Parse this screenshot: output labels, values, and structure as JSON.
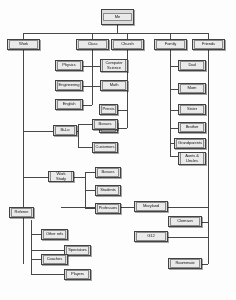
{
  "diagram": {
    "type": "org-chart",
    "root": {
      "label": "Me"
    },
    "branches": [
      {
        "label": "Work"
      },
      {
        "label": "Class"
      },
      {
        "label": "Church"
      },
      {
        "label": "Family"
      },
      {
        "label": "Friends"
      }
    ],
    "nodes": {
      "me": "Me",
      "work": "Work",
      "class": "Class",
      "church": "Church",
      "family": "Family",
      "friends": "Friends",
      "physics": "Physics",
      "computer_science": "Computer Science",
      "engineering": "Engineering",
      "math": "Math",
      "english": "English",
      "priests": "Priests",
      "peers": "Peers",
      "bilo": "Bi-Lo",
      "bilo_bosses": "Bosses",
      "bilo_customers": "Customers",
      "work_study": "Work Study",
      "ws_bosses": "Bosses",
      "ws_students": "Students",
      "ws_professors": "Professors",
      "referee": "Referee",
      "other_refs": "Other refs",
      "spectators": "Spectators",
      "coaches": "Coaches",
      "players": "Players",
      "dad": "Dad",
      "mom": "Mom",
      "sister": "Sister",
      "brother": "Brother",
      "grandparents": "Grandparents",
      "aunts_uncles": "Aunts & Uncles",
      "maryland": "Maryland",
      "clemson": "Clemson",
      "g12": "G12",
      "roommate": "Roommate"
    },
    "colors": {
      "node_fill": "#d9d9d9",
      "node_inner": "#e6e6e6",
      "node_border": "#444444",
      "line": "#4a4a4a",
      "background": "#fdfdfd",
      "text": "#1a1a1a"
    }
  }
}
